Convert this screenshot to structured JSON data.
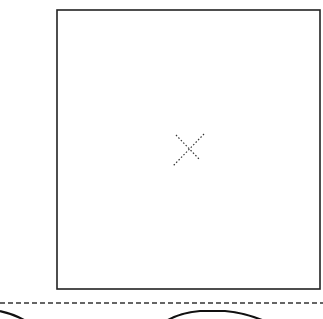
{
  "diagram": {
    "type": "line-drawing",
    "background": "#ffffff",
    "stroke_color": "#1a1a1a",
    "frame": {
      "shape": "rectangle",
      "x": 57,
      "y": 10,
      "width": 263,
      "height": 279
    },
    "center_mark": {
      "shape": "dotted-x",
      "cx": 188,
      "cy": 149
    },
    "dashed_line": {
      "y": 303,
      "x1": 0,
      "x2": 323
    },
    "bottom_arcs": [
      {
        "id": "left-arc",
        "from_x": 0,
        "to_x": 24
      },
      {
        "id": "right-arc",
        "from_x": 165,
        "to_x": 265
      }
    ],
    "text_labels": []
  }
}
